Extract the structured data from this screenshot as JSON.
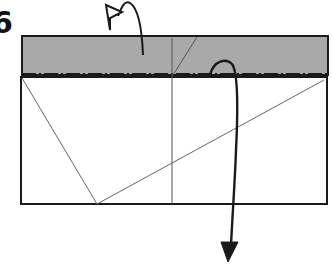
{
  "diagram": {
    "type": "origami-fold-step",
    "step_number": "6",
    "colors": {
      "paper_back": "#a9a9a9",
      "paper_front": "#ffffff",
      "outline": "#1a1a1a",
      "crease": "#555555"
    },
    "elements": {
      "shaded_flap": "Shaded top strip (colored side of paper)",
      "mountain_fold_line": "Dash-dot mountain fold line along bottom of strip",
      "mountain_fold_arrow": "Curved arrow with hollow head: fold behind",
      "pull_down_arrow": "Arrow with solid head pointing down: unfold/pull down",
      "crease_lines": [
        "vertical center crease",
        "short diagonal in strip",
        "left diagonal",
        "long diagonal"
      ]
    }
  }
}
